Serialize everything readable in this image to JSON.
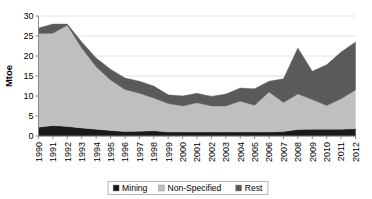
{
  "chart_data": {
    "type": "area",
    "stacked": true,
    "title": "",
    "xlabel": "",
    "ylabel": "Mtoe",
    "ylim": [
      0,
      30
    ],
    "yticks": [
      0,
      5,
      10,
      15,
      20,
      25,
      30
    ],
    "grid": true,
    "legend_position": "bottom",
    "categories": [
      "1990",
      "1991",
      "1992",
      "1993",
      "1994",
      "1995",
      "1996",
      "1997",
      "1998",
      "1999",
      "2000",
      "2001",
      "2002",
      "2003",
      "2004",
      "2005",
      "2006",
      "2007",
      "2008",
      "2009",
      "2010",
      "2011",
      "2012"
    ],
    "series": [
      {
        "name": "Mining",
        "color": "#1a1a1a",
        "values": [
          2.2,
          2.6,
          2.4,
          2.0,
          1.7,
          1.4,
          1.1,
          1.2,
          1.3,
          1.0,
          1.0,
          1.0,
          1.0,
          1.0,
          1.0,
          1.0,
          1.0,
          1.1,
          1.6,
          1.7,
          1.7,
          1.7,
          1.8
        ]
      },
      {
        "name": "Non-Specified",
        "color": "#bfbfbf",
        "values": [
          23.4,
          23.1,
          25.3,
          20.0,
          15.6,
          12.6,
          10.5,
          9.5,
          8.2,
          7.1,
          6.5,
          7.3,
          6.5,
          6.5,
          7.7,
          6.7,
          10.0,
          7.3,
          8.9,
          7.4,
          5.9,
          7.6,
          9.7
        ]
      },
      {
        "name": "Rest",
        "color": "#5a5a5a",
        "values": [
          1.4,
          2.3,
          0.3,
          1.5,
          2.2,
          2.7,
          2.9,
          3.0,
          3.0,
          2.2,
          2.5,
          2.4,
          2.4,
          3.0,
          3.3,
          4.1,
          2.7,
          5.9,
          11.5,
          7.1,
          10.2,
          11.7,
          12.0
        ]
      }
    ],
    "legend": [
      {
        "label": "Mining",
        "color": "#1a1a1a"
      },
      {
        "label": "Non-Specified",
        "color": "#bfbfbf"
      },
      {
        "label": "Rest",
        "color": "#5a5a5a"
      }
    ]
  }
}
